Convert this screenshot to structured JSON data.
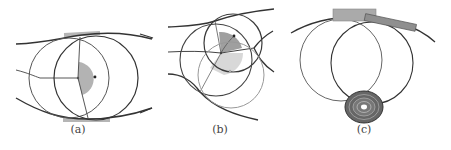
{
  "figure": {
    "panels": [
      {
        "id": "a",
        "label": "(a)",
        "description": "Two overlapping circles touching two curved boundary lines with a shaded half-disc sector at the center"
      },
      {
        "id": "b",
        "label": "(b)",
        "description": "Three circles at a junction of curved lines with dark and light shaded sectors"
      },
      {
        "id": "c",
        "label": "(c)",
        "description": "Two circles hanging from a curved arc with gray rectangular tangents and a concentric dark disc at the bottom"
      }
    ]
  },
  "colors": {
    "stroke_dark": "#3a3a3a",
    "stroke_mid": "#777777",
    "stroke_light": "#aaaaaa",
    "sector_dark": "#9a9a9a",
    "sector_light": "#cfcfcf",
    "rect_fill": "#a9a9a9",
    "disc_dark": "#555555"
  }
}
